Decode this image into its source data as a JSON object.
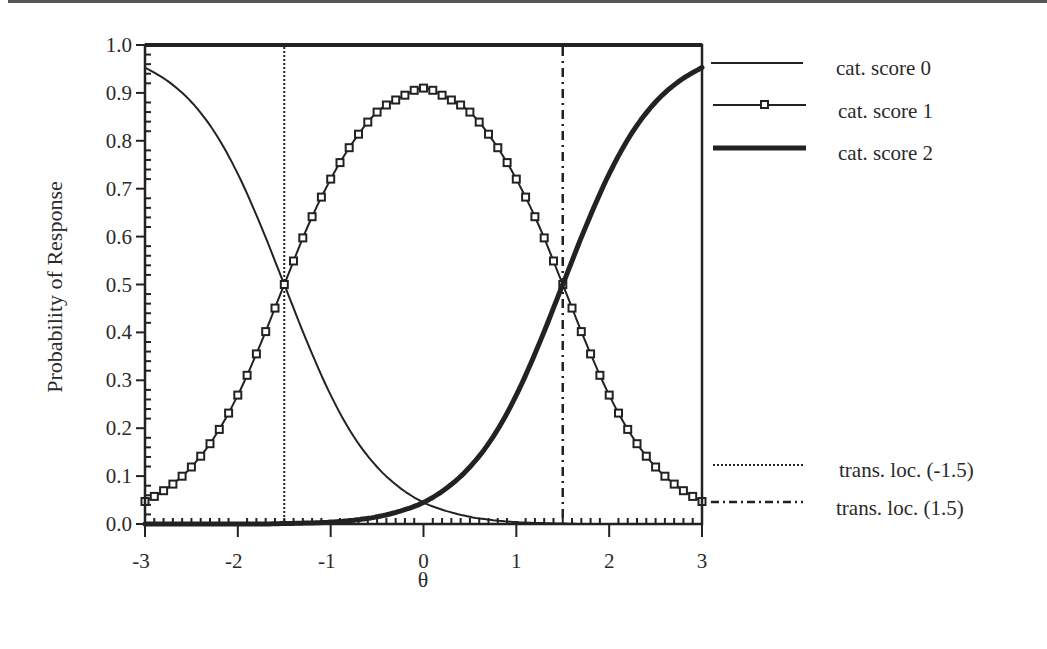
{
  "chart_data": {
    "type": "line",
    "title": "",
    "xlabel": "θ",
    "ylabel": "Probability of Response",
    "xlim": [
      -3,
      3
    ],
    "ylim": [
      0.0,
      1.0
    ],
    "x_ticks": [
      "-3",
      "-2",
      "-1",
      "0",
      "1",
      "2",
      "3"
    ],
    "y_ticks": [
      "0.0",
      "0.1",
      "0.2",
      "0.3",
      "0.4",
      "0.5",
      "0.6",
      "0.7",
      "0.8",
      "0.9",
      "1.0"
    ],
    "grid": false,
    "legend_position": "right",
    "x": [
      -3.0,
      -2.75,
      -2.5,
      -2.25,
      -2.0,
      -1.75,
      -1.5,
      -1.25,
      -1.0,
      -0.75,
      -0.5,
      -0.25,
      0.0,
      0.25,
      0.5,
      0.75,
      1.0,
      1.25,
      1.5,
      1.75,
      2.0,
      2.25,
      2.5,
      2.75,
      3.0
    ],
    "series": [
      {
        "name": "cat. score 0",
        "style": "thin-solid",
        "values": [
          0.953,
          0.924,
          0.881,
          0.818,
          0.731,
          0.622,
          0.5,
          0.378,
          0.269,
          0.182,
          0.119,
          0.075,
          0.045,
          0.027,
          0.015,
          0.008,
          0.004,
          0.002,
          0.001,
          0.0,
          0.0,
          0.0,
          0.0,
          0.0,
          0.0
        ]
      },
      {
        "name": "cat. score 1",
        "style": "solid-square-markers",
        "values": [
          0.047,
          0.076,
          0.119,
          0.182,
          0.269,
          0.378,
          0.5,
          0.62,
          0.72,
          0.8,
          0.86,
          0.89,
          0.91,
          0.89,
          0.86,
          0.8,
          0.72,
          0.62,
          0.5,
          0.378,
          0.269,
          0.182,
          0.119,
          0.076,
          0.047
        ]
      },
      {
        "name": "cat. score 2",
        "style": "thick-solid",
        "values": [
          0.0,
          0.0,
          0.0,
          0.0,
          0.0,
          0.0,
          0.001,
          0.002,
          0.004,
          0.008,
          0.015,
          0.027,
          0.045,
          0.075,
          0.119,
          0.182,
          0.269,
          0.378,
          0.5,
          0.622,
          0.731,
          0.818,
          0.881,
          0.924,
          0.953
        ]
      }
    ],
    "reference_lines": [
      {
        "name": "trans. loc. (-1.5)",
        "x": -1.5,
        "style": "dotted"
      },
      {
        "name": "trans. loc. (1.5)",
        "x": 1.5,
        "style": "dash-dot"
      }
    ],
    "legend": [
      "cat. score 0",
      "cat. score 1",
      "cat. score 2",
      "trans. loc. (-1.5)",
      "trans. loc. (1.5)"
    ]
  },
  "legend": {
    "items": [
      {
        "label": "cat. score 0"
      },
      {
        "label": "cat. score 1"
      },
      {
        "label": "cat. score 2"
      },
      {
        "label": "trans. loc. (-1.5)"
      },
      {
        "label": "trans. loc. (1.5)"
      }
    ]
  },
  "axes": {
    "x_label": "θ",
    "y_label": "Probability of Response"
  },
  "colors": {
    "ink": "#222222",
    "background": "#ffffff"
  }
}
